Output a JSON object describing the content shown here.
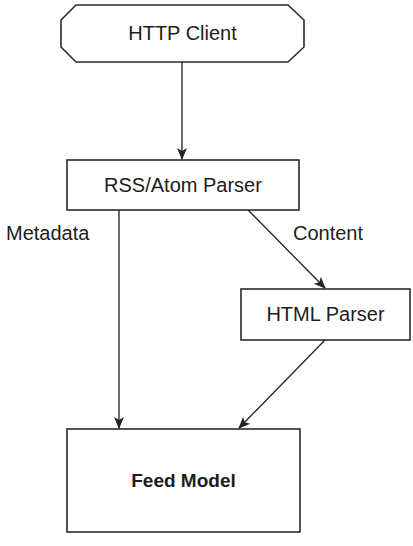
{
  "diagram": {
    "colors": {
      "stroke": "#2b2b2b",
      "background": "#ffffff",
      "text": "#1c1c1c"
    },
    "nodes": [
      {
        "id": "http-client",
        "label": "HTTP Client",
        "shape": "beveled-rectangle",
        "bold": false
      },
      {
        "id": "rss-atom-parser",
        "label": "RSS/Atom Parser",
        "shape": "rectangle",
        "bold": false
      },
      {
        "id": "html-parser",
        "label": "HTML Parser",
        "shape": "rectangle",
        "bold": false
      },
      {
        "id": "feed-model",
        "label": "Feed Model",
        "shape": "rectangle",
        "bold": true
      }
    ],
    "edges": [
      {
        "from": "http-client",
        "to": "rss-atom-parser",
        "label": ""
      },
      {
        "from": "rss-atom-parser",
        "to": "feed-model",
        "label": "Metadata"
      },
      {
        "from": "rss-atom-parser",
        "to": "html-parser",
        "label": "Content"
      },
      {
        "from": "html-parser",
        "to": "feed-model",
        "label": ""
      }
    ]
  }
}
